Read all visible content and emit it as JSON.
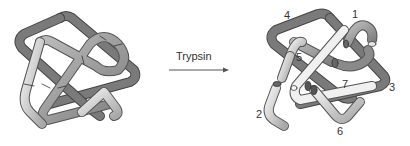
{
  "diagram": {
    "arrow_label": "Trypsin",
    "left_panel": {
      "description": "Intact folded polypeptide chain with cleavage sites marked"
    },
    "right_panel": {
      "description": "Chain after trypsin cleavage into fragments",
      "fragment_labels": [
        "1",
        "2",
        "3",
        "4",
        "5",
        "6",
        "7"
      ]
    },
    "colors": {
      "dark_strand": "#6e6e6e",
      "mid_strand": "#9a9a9a",
      "light_strand": "#cfcfcf",
      "outline": "#555555",
      "text": "#333333"
    }
  }
}
